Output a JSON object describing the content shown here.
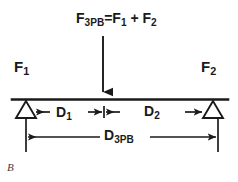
{
  "figure": {
    "panel_letter": "B",
    "background_color": "#ffffff",
    "stroke_color": "#1a1a1a",
    "text_color": "#1a1a1a"
  },
  "diagram": {
    "type": "three-point-bending-free-body-diagram",
    "title_equation": {
      "symbol": "F",
      "subscript": "3PB",
      "equals": "=",
      "term1_symbol": "F",
      "term1_subscript": "1",
      "plus": "+",
      "term2_symbol": "F",
      "term2_subscript": "2"
    },
    "reaction_left": {
      "symbol": "F",
      "subscript": "1"
    },
    "reaction_right": {
      "symbol": "F",
      "subscript": "2"
    },
    "dimension_left": {
      "symbol": "D",
      "subscript": "1"
    },
    "dimension_right": {
      "symbol": "D",
      "subscript": "2"
    },
    "dimension_span": {
      "symbol": "D",
      "subscript": "3PB"
    },
    "elements": {
      "beam": "horizontal-beam-line",
      "support_left": "triangular-pin-support",
      "support_right": "triangular-pin-support",
      "load_arrow": "downward-applied-force-arrow"
    }
  }
}
